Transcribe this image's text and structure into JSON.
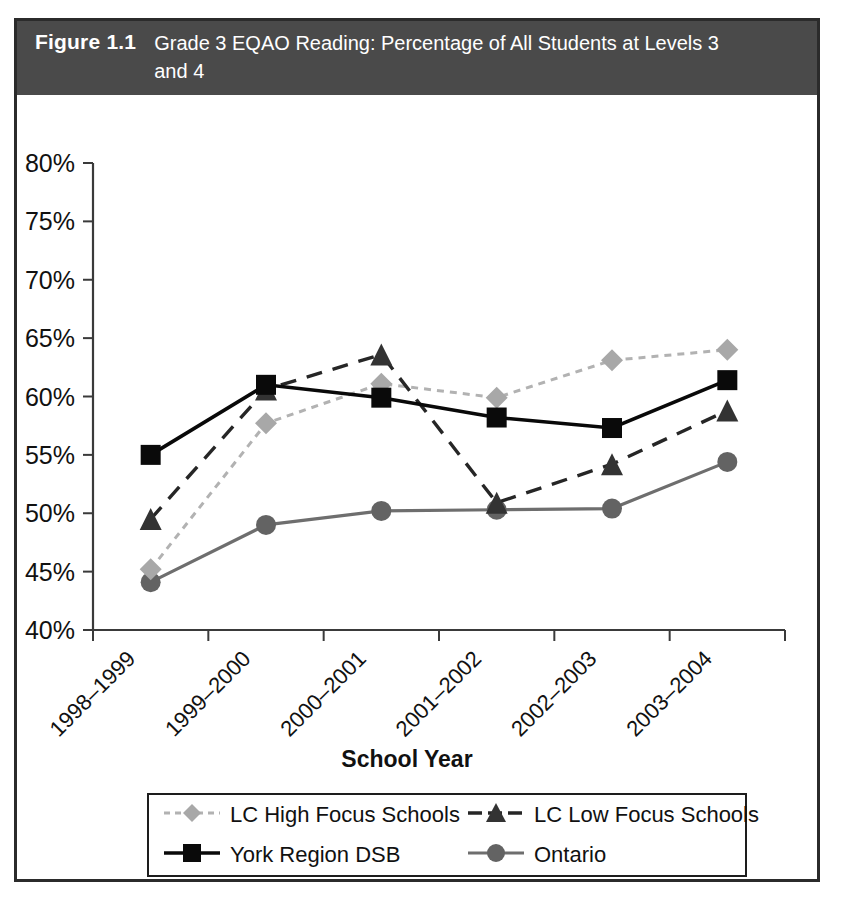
{
  "figure": {
    "number": "Figure 1.1",
    "title": "Grade 3 EQAO Reading: Percentage of All Students at Levels 3 and 4"
  },
  "chart_data": {
    "type": "line",
    "title": "Grade 3 EQAO Reading: Percentage of All Students at Levels 3 and 4",
    "xlabel": "School Year",
    "ylabel": "",
    "categories": [
      "1998–1999",
      "1999–2000",
      "2000–2001",
      "2001–2002",
      "2002–2003",
      "2003–2004"
    ],
    "ylim": [
      40,
      80
    ],
    "ytick_values": [
      40,
      45,
      50,
      55,
      60,
      65,
      70,
      75,
      80
    ],
    "ytick_labels": [
      "40%",
      "45%",
      "50%",
      "55%",
      "60%",
      "65%",
      "70%",
      "75%",
      "80%"
    ],
    "grid": false,
    "legend_position": "bottom",
    "series": [
      {
        "name": "LC High Focus Schools",
        "marker": "diamond",
        "linestyle": "dotted",
        "color": "#a8a8a8",
        "values": [
          45.2,
          57.7,
          61.1,
          59.9,
          63.1,
          64.0
        ]
      },
      {
        "name": "LC Low Focus Schools",
        "marker": "triangle",
        "linestyle": "dashed",
        "color": "#333333",
        "values": [
          49.5,
          60.6,
          63.6,
          50.9,
          54.2,
          58.8
        ]
      },
      {
        "name": "York Region DSB",
        "marker": "square",
        "linestyle": "solid",
        "color": "#0a0a0a",
        "values": [
          55.0,
          61.0,
          59.9,
          58.2,
          57.3,
          61.4
        ]
      },
      {
        "name": "Ontario",
        "marker": "circle",
        "linestyle": "solid",
        "color": "#636363",
        "values": [
          44.1,
          49.0,
          50.2,
          50.3,
          50.4,
          54.4
        ]
      }
    ]
  },
  "legend": {
    "entries": [
      {
        "label": "LC High Focus Schools",
        "marker": "diamond-marker-icon"
      },
      {
        "label": "LC Low Focus Schools",
        "marker": "triangle-marker-icon"
      },
      {
        "label": "York Region DSB",
        "marker": "square-marker-icon"
      },
      {
        "label": "Ontario",
        "marker": "circle-marker-icon"
      }
    ]
  }
}
